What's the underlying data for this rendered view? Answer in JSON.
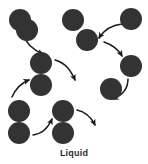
{
  "figure": {
    "caption": "Liquid",
    "background_color": "#ffffff",
    "particle_color": "#333333",
    "arrow_color": "#1a1a1a",
    "particle_radius": 11,
    "particle_count": 13,
    "arrow_count": 8
  },
  "chart_data": {
    "type": "scatter",
    "title": "Liquid",
    "xlabel": "",
    "ylabel": "",
    "xlim": [
      0,
      148
    ],
    "ylim": [
      0,
      164
    ],
    "grid": false,
    "legend": null,
    "series": [
      {
        "name": "particles",
        "marker": "circle",
        "color": "#333333",
        "radius": 11,
        "points": [
          {
            "id": "p1",
            "x": 20,
            "y": 20
          },
          {
            "id": "p2",
            "x": 73,
            "y": 20
          },
          {
            "id": "p3",
            "x": 131,
            "y": 19
          },
          {
            "id": "p4",
            "x": 87,
            "y": 40
          },
          {
            "id": "p5",
            "x": 41,
            "y": 63
          },
          {
            "id": "p6",
            "x": 41,
            "y": 85
          },
          {
            "id": "p7",
            "x": 131,
            "y": 66
          },
          {
            "id": "p8",
            "x": 111,
            "y": 89
          },
          {
            "id": "p9",
            "x": 19,
            "y": 111
          },
          {
            "id": "p10",
            "x": 19,
            "y": 133
          },
          {
            "id": "p11",
            "x": 63,
            "y": 111
          },
          {
            "id": "p12",
            "x": 63,
            "y": 133
          },
          {
            "id": "p13",
            "x": 27,
            "y": 30
          }
        ]
      },
      {
        "name": "motion-arrows",
        "marker": "curved-arrow",
        "color": "#1a1a1a",
        "arrows": [
          {
            "id": "a1",
            "from": "p1",
            "to": "p5",
            "label": "",
            "path": "M 22 33 C 26 44 33 50 43 54"
          },
          {
            "id": "a2",
            "from": "p5",
            "to": "open",
            "label": "",
            "path": "M 55 60 C 66 63 71 71 75 80"
          },
          {
            "id": "a3",
            "from": "p3",
            "to": "p4",
            "label": "",
            "path": "M 122 24 C 112 25 104 30 99 38"
          },
          {
            "id": "a4",
            "from": "p4",
            "to": "p7",
            "label": "",
            "path": "M 104 42 C 113 45 118 49 122 56"
          },
          {
            "id": "a5",
            "from": "p7",
            "to": "p8",
            "label": "",
            "path": "M 128 79 C 128 89 123 95 113 99"
          },
          {
            "id": "a6",
            "from": "open",
            "to": "p6",
            "label": "",
            "path": "M 12 97 C 16 88 21 83 29 80"
          },
          {
            "id": "a7",
            "from": "p10",
            "to": "p11",
            "label": "",
            "path": "M 33 135 C 42 134 48 128 52 119"
          },
          {
            "id": "a8",
            "from": "p11",
            "to": "open",
            "label": "",
            "path": "M 77 110 C 86 112 91 117 95 125"
          }
        ]
      }
    ]
  }
}
